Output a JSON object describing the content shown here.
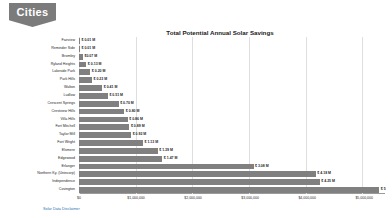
{
  "logo": {
    "label": "Cities",
    "shape_color": "#7b7b7b",
    "text_color": "#ffffff"
  },
  "footer": {
    "disclaimer_link": "Solar Data Disclaimer",
    "link_color": "#2f6fb0"
  },
  "chart_data": {
    "type": "bar",
    "orientation": "horizontal",
    "title": "Total Potential Annual Solar Savings",
    "xlabel": "",
    "ylabel": "",
    "xlim": [
      0,
      5400000
    ],
    "grid": true,
    "legend": false,
    "bar_color": "#808080",
    "tick_labels": [
      "$0",
      "$1,000,000",
      "$2,000,000",
      "$3,000,000",
      "$4,000,000",
      "$5,000,000"
    ],
    "tick_values": [
      0,
      1000000,
      2000000,
      3000000,
      4000000,
      5000000
    ],
    "categories": [
      "Fairview",
      "Reminder Side",
      "Bromley",
      "Ryland Heights",
      "Lakeside Park",
      "Park Hills",
      "Walton",
      "Ludlow",
      "Crescent Springs",
      "Crestview Hills",
      "Villa Hills",
      "Fort Mitchell",
      "Taylor Mill",
      "Fort Wright",
      "Elsmere",
      "Edgewood",
      "Erlanger",
      "Northern Ky. (Unincorp)",
      "Independence",
      "Covington"
    ],
    "values": [
      10000,
      10000,
      70000,
      130000,
      200000,
      230000,
      410000,
      510000,
      700000,
      800000,
      860000,
      890000,
      920000,
      1130000,
      1390000,
      1470000,
      3080000,
      4180000,
      4250000,
      5300000
    ],
    "value_labels": [
      "$ 0.01 M",
      "$ 0.01 M",
      "$0.07 M",
      "$ 0.13 M",
      "$ 0.20 M",
      "$ 0.23 M",
      "$ 0.41 M",
      "$ 0.51 M",
      "$ 0.70 M",
      "$ 0.80 M",
      "$ 0.86 M",
      "$ 0.89 M",
      "$ 0.92 M",
      "$ 1.13 M",
      "$ 1.39 M",
      "$ 1.47 M",
      "$ 3.08 M",
      "$ 4.18 M",
      "$ 4.25 M",
      "$ 5"
    ]
  }
}
